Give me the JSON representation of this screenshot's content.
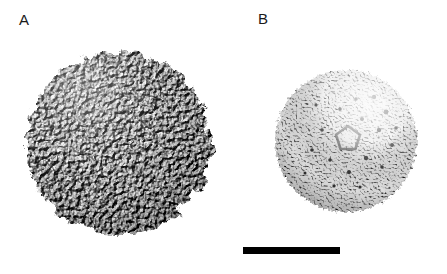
{
  "figure": {
    "type": "electron-microscopy-reconstruction",
    "background_color": "#ffffff",
    "width": 447,
    "height": 274
  },
  "panels": [
    {
      "id": "a",
      "label": "A",
      "label_x": 19,
      "label_y": 12,
      "description": "Surface rendering of an icosahedral virus capsid showing rough, protruding capsomere subunits",
      "center_x": 118,
      "center_y": 143,
      "radius": 98,
      "surface": "rough-protruding",
      "texture_scale": 0.22,
      "texture_detail": 5,
      "roughness": 1.0,
      "shading_light_x": -0.45,
      "shading_light_y": -0.6,
      "base_gray": "#8c8c8c",
      "dark_gray": "#2e2e2e",
      "light_gray": "#f0f0f0",
      "edge_displacement": 9
    },
    {
      "id": "b",
      "label": "B",
      "label_x": 258,
      "label_y": 11,
      "description": "Smoother spherical shell reconstruction with fine granular surface, pentagonal depression at the five-fold axis and small dark pores",
      "center_x": 346,
      "center_y": 141,
      "radius": 74,
      "surface": "fine-granular",
      "texture_scale": 0.55,
      "texture_detail": 4,
      "roughness": 0.55,
      "shading_light_x": 0.35,
      "shading_light_y": -0.5,
      "base_gray": "#b4b4b4",
      "dark_gray": "#3a3a3a",
      "light_gray": "#fbfbfb",
      "edge_displacement": 4,
      "highlight_x": 372,
      "highlight_y": 110,
      "highlight_radius": 46,
      "pentagon_x": 348,
      "pentagon_y": 137,
      "pentagon_radius": 11,
      "pores": [
        {
          "x": 374,
          "y": 97,
          "r": 2.2
        },
        {
          "x": 386,
          "y": 112,
          "r": 2.4
        },
        {
          "x": 379,
          "y": 130,
          "r": 2.2
        },
        {
          "x": 392,
          "y": 145,
          "r": 2.0
        },
        {
          "x": 362,
          "y": 119,
          "r": 2.0
        },
        {
          "x": 356,
          "y": 99,
          "r": 1.8
        },
        {
          "x": 340,
          "y": 109,
          "r": 1.8
        },
        {
          "x": 366,
          "y": 158,
          "r": 2.2
        },
        {
          "x": 349,
          "y": 172,
          "r": 2.0
        },
        {
          "x": 330,
          "y": 160,
          "r": 1.8
        },
        {
          "x": 322,
          "y": 130,
          "r": 1.8
        },
        {
          "x": 312,
          "y": 150,
          "r": 1.8
        },
        {
          "x": 396,
          "y": 128,
          "r": 1.8
        },
        {
          "x": 382,
          "y": 167,
          "r": 1.8
        },
        {
          "x": 316,
          "y": 105,
          "r": 1.6
        },
        {
          "x": 334,
          "y": 186,
          "r": 1.6
        }
      ]
    }
  ],
  "scale_bar": {
    "name": "scale-bar",
    "x": 243,
    "y": 247,
    "width": 97,
    "height": 7,
    "color": "#000000",
    "label": ""
  }
}
